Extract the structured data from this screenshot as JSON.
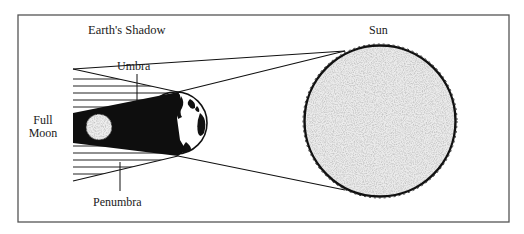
{
  "diagram": {
    "title": "Earth's Shadow",
    "labels": {
      "sun": "Sun",
      "umbra": "Umbra",
      "penumbra": "Penumbra",
      "moon_line1": "Full",
      "moon_line2": "Moon"
    },
    "colors": {
      "ink": "#111111",
      "frame": "#555555",
      "sun_fill": "#e6e6e6",
      "moon_fill": "#ececec",
      "background": "#ffffff"
    },
    "elements": [
      {
        "name": "sun",
        "shape": "circle",
        "cx": 380,
        "cy": 121,
        "r": 76
      },
      {
        "name": "earth",
        "shape": "circle",
        "cx": 176,
        "cy": 123,
        "r": 31
      },
      {
        "name": "full-moon",
        "shape": "circle",
        "cx": 99,
        "cy": 127,
        "r": 13
      },
      {
        "name": "umbra",
        "shape": "wedge"
      },
      {
        "name": "penumbra",
        "shape": "hatched-wedge"
      }
    ]
  }
}
